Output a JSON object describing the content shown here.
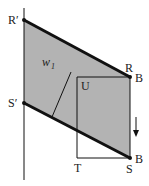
{
  "diagram": {
    "type": "geometric-construction",
    "colors": {
      "fill": "#b3b3b3",
      "line": "#111111",
      "background": "#ffffff"
    },
    "labels": {
      "r_prime": "R′",
      "s_prime": "S′",
      "r": "R",
      "b_top": "B",
      "u": "U",
      "w": "w",
      "w_sub": "1",
      "t": "T",
      "s": "S",
      "b_bottom": "B"
    },
    "points": {
      "R_prime": [
        24,
        20
      ],
      "R": [
        130,
        77
      ],
      "S_prime": [
        24,
        103
      ],
      "S": [
        130,
        158
      ],
      "U": [
        77,
        77
      ],
      "T": [
        77,
        158
      ]
    },
    "arrow": {
      "direction": "down",
      "x": 136,
      "y_start": 117,
      "y_end": 136
    }
  }
}
